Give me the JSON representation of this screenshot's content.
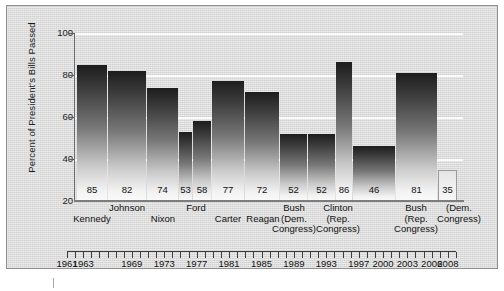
{
  "chart_data": {
    "type": "bar",
    "title": "",
    "xlabel": "",
    "ylabel": "Percent of President's Bills Passed",
    "ylim": [
      20,
      100
    ],
    "ytick_labels": [
      "20",
      "40",
      "60",
      "80",
      "100"
    ],
    "grid": "horizontal white gridlines at 40, 60, 80, 100",
    "legend": "none",
    "categories": [
      "Kennedy",
      "Johnson",
      "Nixon",
      "Ford",
      "Carter",
      "Reagan",
      "Reagan",
      "Bush (Dem. Congress)",
      "Clinton",
      "Clinton (Rep. Congress)",
      "Bush (Rep. Congress)",
      "Bush",
      "Bush (Dem. Congress)"
    ],
    "values": [
      85,
      82,
      74,
      53,
      58,
      77,
      72,
      52,
      52,
      86,
      46,
      81,
      35
    ],
    "bars": [
      {
        "value": 85,
        "label": "85",
        "style": "filled"
      },
      {
        "value": 82,
        "label": "82",
        "style": "filled"
      },
      {
        "value": 74,
        "label": "74",
        "style": "filled"
      },
      {
        "value": 53,
        "label": "53",
        "style": "filled"
      },
      {
        "value": 58,
        "label": "58",
        "style": "filled"
      },
      {
        "value": 77,
        "label": "77",
        "style": "filled"
      },
      {
        "value": 72,
        "label": "72",
        "style": "filled"
      },
      {
        "value": 52,
        "label": "52",
        "style": "filled"
      },
      {
        "value": 52,
        "label": "52",
        "style": "filled"
      },
      {
        "value": 86,
        "label": "86",
        "style": "filled"
      },
      {
        "value": 46,
        "label": "46",
        "style": "filled"
      },
      {
        "value": 81,
        "label": "81",
        "style": "filled"
      },
      {
        "value": 35,
        "label": "35",
        "style": "outlined"
      }
    ],
    "timeline_years": [
      "1961",
      "1963",
      "1969",
      "1973",
      "1977",
      "1981",
      "1985",
      "1989",
      "1993",
      "1997",
      "2000",
      "2003",
      "2006",
      "2008"
    ],
    "president_labels": [
      {
        "line1": "Kennedy",
        "line2": "",
        "line3": "",
        "row": "lower"
      },
      {
        "line1": "Johnson",
        "line2": "",
        "line3": "",
        "row": "upper"
      },
      {
        "line1": "Nixon",
        "line2": "",
        "line3": "",
        "row": "lower"
      },
      {
        "line1": "Ford",
        "line2": "",
        "line3": "",
        "row": "upper"
      },
      {
        "line1": "Carter",
        "line2": "",
        "line3": "",
        "row": "lower"
      },
      {
        "line1": "Reagan",
        "line2": "",
        "line3": "",
        "row": "lower"
      },
      {
        "line1": "Bush",
        "line2": "(Dem.",
        "line3": "Congress)",
        "row": "upper"
      },
      {
        "line1": "Clinton",
        "line2": "(Rep.",
        "line3": "Congress)",
        "row": "upper"
      },
      {
        "line1": "Bush",
        "line2": "(Rep.",
        "line3": "Congress)",
        "row": "upper"
      },
      {
        "line1": "",
        "line2": "(Dem.",
        "line3": "Congress)",
        "row": "upper"
      }
    ]
  },
  "axis": {
    "y_label": "Percent of President's Bills Passed",
    "y_ticks": [
      "100",
      "80",
      "60",
      "40",
      "20"
    ]
  }
}
